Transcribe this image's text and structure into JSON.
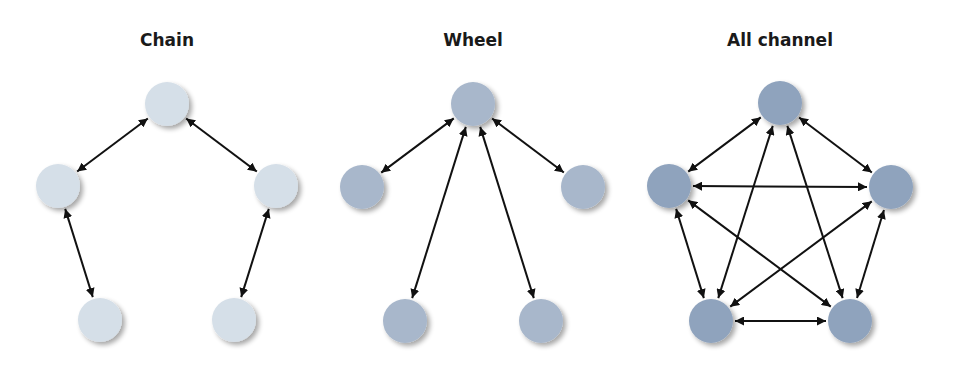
{
  "colors": {
    "chain_node": "#d5dfe8",
    "wheel_node": "#a8b7cb",
    "allchannel_node": "#8fa3bd",
    "arrow": "#111111",
    "background": "#ffffff"
  },
  "diagrams": [
    {
      "title": "Chain",
      "title_x": 167,
      "node_color_key": "chain_node",
      "nodes": [
        {
          "id": "top",
          "x": 167,
          "y": 104
        },
        {
          "id": "left",
          "x": 58,
          "y": 186
        },
        {
          "id": "right",
          "x": 276,
          "y": 186
        },
        {
          "id": "bottom-left",
          "x": 100,
          "y": 320
        },
        {
          "id": "bottom-right",
          "x": 234,
          "y": 320
        }
      ],
      "edges": [
        [
          "top",
          "left"
        ],
        [
          "top",
          "right"
        ],
        [
          "left",
          "bottom-left"
        ],
        [
          "right",
          "bottom-right"
        ]
      ]
    },
    {
      "title": "Wheel",
      "title_x": 473,
      "node_color_key": "wheel_node",
      "nodes": [
        {
          "id": "top",
          "x": 473,
          "y": 104
        },
        {
          "id": "left",
          "x": 362,
          "y": 187
        },
        {
          "id": "right",
          "x": 583,
          "y": 187
        },
        {
          "id": "bottom-left",
          "x": 405,
          "y": 321
        },
        {
          "id": "bottom-right",
          "x": 541,
          "y": 321
        }
      ],
      "edges": [
        [
          "top",
          "left"
        ],
        [
          "top",
          "right"
        ],
        [
          "top",
          "bottom-left"
        ],
        [
          "top",
          "bottom-right"
        ]
      ]
    },
    {
      "title": "All channel",
      "title_x": 780,
      "node_color_key": "allchannel_node",
      "nodes": [
        {
          "id": "top",
          "x": 780,
          "y": 103
        },
        {
          "id": "left",
          "x": 669,
          "y": 186
        },
        {
          "id": "right",
          "x": 891,
          "y": 187
        },
        {
          "id": "bottom-left",
          "x": 711,
          "y": 321
        },
        {
          "id": "bottom-right",
          "x": 850,
          "y": 321
        }
      ],
      "edges": [
        [
          "top",
          "left"
        ],
        [
          "top",
          "right"
        ],
        [
          "top",
          "bottom-left"
        ],
        [
          "top",
          "bottom-right"
        ],
        [
          "left",
          "right"
        ],
        [
          "left",
          "bottom-left"
        ],
        [
          "left",
          "bottom-right"
        ],
        [
          "right",
          "bottom-left"
        ],
        [
          "right",
          "bottom-right"
        ],
        [
          "bottom-left",
          "bottom-right"
        ]
      ]
    }
  ],
  "node_radius": 22
}
